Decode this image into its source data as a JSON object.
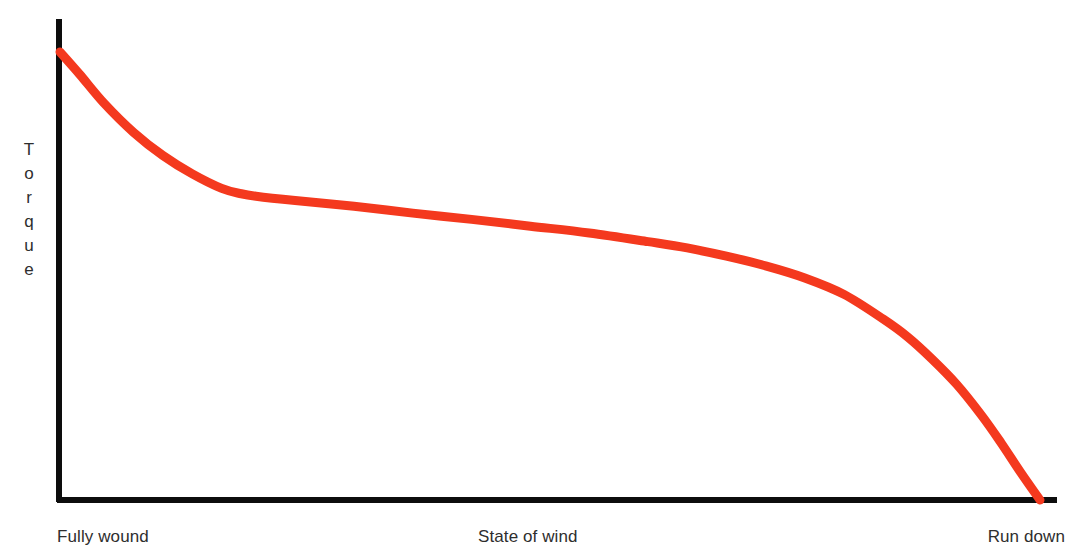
{
  "figure": {
    "background": "#ffffff",
    "width": 1076,
    "height": 555
  },
  "axes": {
    "color": "#0d0d0d",
    "y_axis": {
      "x": 59,
      "y_top": 19,
      "y_bottom": 503,
      "thickness": 6
    },
    "x_axis": {
      "y": 500,
      "x_left": 57,
      "x_right": 1057,
      "thickness": 6
    }
  },
  "labels": {
    "y_axis_title": "Torque",
    "y_axis_letters": [
      "T",
      "o",
      "r",
      "q",
      "u",
      "e"
    ],
    "x_axis_left": "Fully wound",
    "x_axis_center": "State of wind",
    "x_axis_right": "Run down",
    "text_color": "#2e2e2e"
  },
  "chart_data": {
    "type": "line",
    "title": "",
    "subtitle": "",
    "xlabel": "State of wind",
    "ylabel": "Torque",
    "grid": false,
    "legend": false,
    "legend_position": "none",
    "xlim": [
      0,
      100
    ],
    "ylim": [
      0,
      100
    ],
    "xticks": [],
    "yticks": [],
    "xtick_labels": [
      "Fully wound",
      "State of wind",
      "Run down"
    ],
    "ytick_labels": [],
    "annotations": [],
    "series": [
      {
        "name": "Mainspring torque",
        "color": "#f4391e",
        "line_width": 9,
        "x": [
          0.0,
          2.0,
          4.5,
          7.5,
          10.5,
          13.5,
          16.5,
          18.5,
          20.0,
          24.0,
          30.0,
          36.0,
          42.0,
          48.0,
          54.0,
          60.0,
          64.0,
          68.0,
          72.0,
          76.0,
          80.0,
          84.0,
          86.5,
          89.0,
          91.5,
          94.0,
          96.0,
          98.0,
          100.0
        ],
        "y": [
          92.6,
          88.0,
          82.0,
          76.0,
          71.2,
          67.4,
          64.4,
          63.3,
          62.8,
          61.9,
          60.7,
          59.3,
          58.0,
          56.6,
          55.2,
          53.4,
          52.1,
          50.4,
          48.4,
          45.9,
          42.5,
          37.4,
          33.7,
          29.1,
          23.9,
          17.6,
          11.9,
          5.8,
          0.0
        ],
        "notes": "Torque decays steeply from full wind, plateaus across the middle of the wind, then collapses rapidly as the mainspring runs down."
      }
    ]
  },
  "svg_path": {
    "curve": "M 60,52 C 78,66 96,96 116,125 C 140,159 170,183 205,192 C 222,196 238,196 252,197 C 300,200 350,204 400,209 C 470,216 560,226 640,234 C 700,240 760,250 805,263 C 845,275 872,285 898,297 C 920,309 938,330 954,362 C 972,398 995,440 1015,468 C 1026,483 1034,493 1040,500"
  }
}
